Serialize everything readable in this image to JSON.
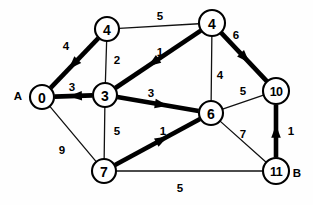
{
  "diagram": {
    "background_color": "#fefefe",
    "stroke_color": "#000000",
    "node_fill_color": "#ffffff",
    "width": 313,
    "height": 205
  },
  "nodes": [
    {
      "id": "n4a",
      "label": "4",
      "x": 107,
      "y": 29,
      "r": 12
    },
    {
      "id": "n4b",
      "label": "4",
      "x": 212,
      "y": 23,
      "r": 13
    },
    {
      "id": "n0",
      "label": "0",
      "x": 42,
      "y": 97,
      "r": 12
    },
    {
      "id": "n3",
      "label": "3",
      "x": 105,
      "y": 95,
      "r": 12
    },
    {
      "id": "n6",
      "label": "6",
      "x": 211,
      "y": 113,
      "r": 12
    },
    {
      "id": "n10",
      "label": "10",
      "x": 276,
      "y": 91,
      "r": 13
    },
    {
      "id": "n7",
      "label": "7",
      "x": 104,
      "y": 171,
      "r": 12
    },
    {
      "id": "n11",
      "label": "11",
      "x": 276,
      "y": 171,
      "r": 13
    }
  ],
  "terminals": [
    {
      "name": "source-terminal-a",
      "label": "A",
      "x": 18,
      "y": 96
    },
    {
      "name": "target-terminal-b",
      "label": "B",
      "x": 297,
      "y": 173
    }
  ],
  "edges": [
    {
      "id": "e-4a-4b",
      "from": "n4a",
      "to": "n4b",
      "weight": "5",
      "bold": false,
      "directed": false,
      "label_x": 160,
      "label_y": 16
    },
    {
      "id": "e-4a-0",
      "from": "n4a",
      "to": "n0",
      "weight": "4",
      "bold": true,
      "directed": true,
      "label_x": 66,
      "label_y": 46
    },
    {
      "id": "e-4a-3",
      "from": "n4a",
      "to": "n3",
      "weight": "2",
      "bold": false,
      "directed": false,
      "label_x": 117,
      "label_y": 60
    },
    {
      "id": "e-3-0",
      "from": "n3",
      "to": "n0",
      "weight": "3",
      "bold": true,
      "directed": true,
      "label_x": 72,
      "label_y": 87
    },
    {
      "id": "e-4b-3",
      "from": "n4b",
      "to": "n3",
      "weight": "1",
      "bold": true,
      "directed": true,
      "label_x": 160,
      "label_y": 52
    },
    {
      "id": "e-4b-10",
      "from": "n4b",
      "to": "n10",
      "weight": "6",
      "bold": true,
      "directed": true,
      "label_x": 236,
      "label_y": 35
    },
    {
      "id": "e-4b-6",
      "from": "n4b",
      "to": "n6",
      "weight": "4",
      "bold": false,
      "directed": false,
      "label_x": 220,
      "label_y": 75
    },
    {
      "id": "e-3-6",
      "from": "n3",
      "to": "n6",
      "weight": "3",
      "bold": true,
      "directed": true,
      "label_x": 151,
      "label_y": 93
    },
    {
      "id": "e-6-10",
      "from": "n6",
      "to": "n10",
      "weight": "5",
      "bold": false,
      "directed": false,
      "label_x": 243,
      "label_y": 91
    },
    {
      "id": "e-3-7",
      "from": "n3",
      "to": "n7",
      "weight": "5",
      "bold": false,
      "directed": false,
      "label_x": 117,
      "label_y": 131
    },
    {
      "id": "e-0-7",
      "from": "n0",
      "to": "n7",
      "weight": "9",
      "bold": false,
      "directed": false,
      "label_x": 62,
      "label_y": 150
    },
    {
      "id": "e-7-6",
      "from": "n7",
      "to": "n6",
      "weight": "1",
      "bold": true,
      "directed": true,
      "label_x": 163,
      "label_y": 131
    },
    {
      "id": "e-6-11",
      "from": "n6",
      "to": "n11",
      "weight": "7",
      "bold": false,
      "directed": false,
      "label_x": 243,
      "label_y": 134
    },
    {
      "id": "e-11-10",
      "from": "n11",
      "to": "n10",
      "weight": "1",
      "bold": true,
      "directed": true,
      "label_x": 291,
      "label_y": 131
    },
    {
      "id": "e-7-11",
      "from": "n7",
      "to": "n11",
      "weight": "5",
      "bold": false,
      "directed": false,
      "label_x": 180,
      "label_y": 188
    }
  ]
}
